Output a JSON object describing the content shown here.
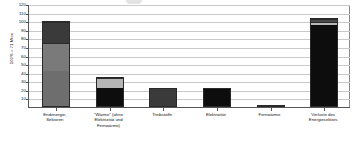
{
  "chart_data": {
    "type": "bar",
    "stacked": true,
    "title": "",
    "subtitle": "",
    "xlabel": "",
    "ylabel": "100% = 71 Mtoe",
    "ylim": [
      0,
      120
    ],
    "ytick_step": 10,
    "yticks": [
      120,
      110,
      100,
      90,
      80,
      70,
      60,
      50,
      40,
      30,
      20,
      10
    ],
    "grid": true,
    "legend": "none",
    "categories": [
      "Endenergie,\nSektoren",
      "\"Wärme\" (ohne\nElektrizität und\nFernwärme)",
      "Treibstoffe",
      "Elektrizität",
      "Fernwärme",
      "Verluste des\nEnergiesektors"
    ],
    "totals": [
      100,
      35,
      22,
      22,
      0.6,
      104
    ],
    "series": [
      {
        "name": "Segment 1 (unten)",
        "values": [
          42,
          22,
          22,
          22,
          0.6,
          96
        ],
        "color": "#6e6e6e"
      },
      {
        "name": "Segment 2",
        "values": [
          33,
          13,
          0,
          0,
          0,
          4
        ],
        "color": "#b5b5b5"
      },
      {
        "name": "Segment 3 (oben)",
        "values": [
          25,
          0,
          0,
          0,
          0,
          4
        ],
        "color": "#3a3a3a"
      }
    ],
    "bar_fills": [
      [
        "#6e6e6e",
        "#7a7a7a",
        "#3a3a3a"
      ],
      [
        "#0d0d0d",
        "#b5b5b5"
      ],
      [
        "#3a3a3a"
      ],
      [
        "#0d0d0d"
      ],
      [
        "#1a1a1a"
      ],
      [
        "#0d0d0d",
        "#b8b8b8",
        "#4a4a4a"
      ]
    ],
    "colors": {
      "axis": "#555555",
      "grid": "#c9c9c9",
      "plot_background": "#ffffff",
      "text": "#111111"
    }
  }
}
